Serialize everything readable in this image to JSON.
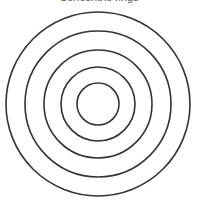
{
  "caption": "Concentric rings",
  "diagram": {
    "type": "concentric-circles",
    "center": [
      98,
      104
    ],
    "radii": [
      92,
      73,
      54,
      37,
      21
    ],
    "stroke": "#333333",
    "stroke_width": 1.6
  }
}
